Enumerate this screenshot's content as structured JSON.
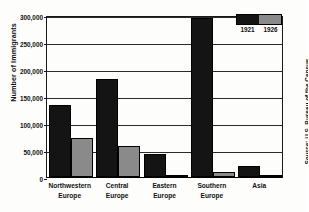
{
  "chart_data": {
    "type": "bar",
    "title": "",
    "xlabel": "",
    "ylabel": "Number of Immigrants",
    "categories": [
      "Northwestern Europe",
      "Central Europe",
      "Eastern Europe",
      "Southern Europe",
      "Asia"
    ],
    "categories_lines": [
      [
        "Northwestern",
        "Europe"
      ],
      [
        "Central",
        "Europe"
      ],
      [
        "Eastern",
        "Europe"
      ],
      [
        "Southern",
        "Europe"
      ],
      [
        "Asia",
        ""
      ]
    ],
    "series": [
      {
        "name": "1921",
        "color": "#141414",
        "values": [
          133000,
          182000,
          42000,
          294000,
          20000
        ]
      },
      {
        "name": "1926",
        "color": "#8a8a8a",
        "values": [
          73000,
          57000,
          3000,
          9000,
          1500
        ]
      }
    ],
    "ylim": [
      0,
      300000
    ],
    "yticks": [
      0,
      50000,
      100000,
      150000,
      200000,
      250000,
      300000
    ],
    "ytick_labels": [
      "0",
      "50,000",
      "100,000",
      "150,000",
      "200,000",
      "250,000",
      "300,000"
    ],
    "grid": true,
    "legend_position": "top-right",
    "source": "Source: U.S. Bureau of the Census"
  }
}
